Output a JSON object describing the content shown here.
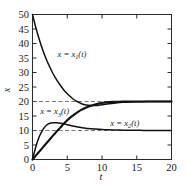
{
  "chart_data": {
    "type": "line",
    "title": "",
    "xlabel": "t",
    "ylabel": "x",
    "xlim": [
      0,
      20
    ],
    "ylim": [
      0,
      50
    ],
    "grid": false,
    "legend_position": "inline-annotations",
    "xticks": [
      "0",
      "5",
      "10",
      "15",
      "20"
    ],
    "xtick_values": [
      0,
      5,
      10,
      15,
      20
    ],
    "yticks": [
      "0",
      "5",
      "10",
      "15",
      "20",
      "25",
      "30",
      "35",
      "40",
      "45",
      "50"
    ],
    "ytick_values": [
      0,
      5,
      10,
      15,
      20,
      25,
      30,
      35,
      40,
      45,
      50
    ],
    "annotations": [
      {
        "name": "label-x1",
        "text_plain": "x = x1(t)",
        "base": "x = x",
        "sub": "1",
        "tail": "(t)",
        "x": 3.6,
        "y": 36.5
      },
      {
        "name": "label-x3",
        "text_plain": "x = x3(t)",
        "base": "x = x",
        "sub": "3",
        "tail": "(t)",
        "x": 1.1,
        "y": 16.6
      },
      {
        "name": "label-x2",
        "text_plain": "x = x2(t)",
        "base": "x = x",
        "sub": "2",
        "tail": "(t)",
        "x": 11.2,
        "y": 12.6
      }
    ],
    "asymptotes": [
      {
        "name": "asymptote-20",
        "value": 20,
        "style": "dashed"
      },
      {
        "name": "asymptote-10",
        "value": 10,
        "style": "dashed"
      }
    ],
    "series": [
      {
        "name": "x1",
        "label": "x = x1(t)",
        "start": 50,
        "limit": 20,
        "description": "exponential decay from 50 to asymptote 20",
        "x": [
          0,
          0.5,
          1,
          1.5,
          2,
          2.5,
          3,
          3.5,
          4,
          4.5,
          5,
          5.5,
          6,
          6.5,
          7,
          7.5,
          8,
          9,
          10,
          11,
          12,
          13,
          14,
          15,
          16,
          17,
          18,
          19,
          20
        ],
        "values": [
          50.0,
          45.3,
          41.2,
          37.6,
          34.5,
          31.8,
          29.4,
          27.4,
          25.6,
          24.0,
          22.7,
          21.6,
          20.6,
          19.9,
          19.3,
          18.9,
          18.7,
          18.6,
          18.9,
          19.2,
          19.5,
          19.7,
          19.8,
          19.9,
          19.95,
          20.0,
          20.0,
          20.0,
          20.0
        ]
      },
      {
        "name": "x2",
        "label": "x = x2(t)",
        "start": 0,
        "limit": 20,
        "description": "monotone rise from 0 to asymptote 20",
        "x": [
          0,
          0.5,
          1,
          1.5,
          2,
          2.5,
          3,
          3.5,
          4,
          4.5,
          5,
          5.5,
          6,
          6.5,
          7,
          7.5,
          8,
          8.5,
          9,
          9.5,
          10,
          11,
          12,
          13,
          14,
          15,
          16,
          17,
          18,
          19,
          20
        ],
        "values": [
          0.0,
          1.4,
          2.8,
          4.2,
          5.6,
          7.0,
          8.4,
          9.7,
          11.0,
          12.3,
          13.5,
          14.6,
          15.5,
          16.3,
          17.1,
          17.7,
          18.2,
          18.6,
          19.0,
          19.3,
          19.5,
          19.8,
          19.9,
          20.0,
          20.0,
          20.0,
          20.0,
          20.0,
          20.0,
          20.0,
          20.0
        ]
      },
      {
        "name": "x3",
        "label": "x = x3(t)",
        "start": 0,
        "limit": 10,
        "peak_x": 3.0,
        "peak_y": 12.7,
        "description": "rises from 0 to peak 12.7 near t=3 then decays to asymptote 10",
        "x": [
          0,
          0.5,
          1,
          1.5,
          2,
          2.5,
          3,
          3.5,
          4,
          4.5,
          5,
          5.5,
          6,
          6.5,
          7,
          7.5,
          8,
          9,
          10,
          11,
          12,
          13,
          14,
          15,
          16,
          17,
          18,
          19,
          20
        ],
        "values": [
          0.0,
          4.6,
          8.0,
          10.3,
          11.8,
          12.5,
          12.7,
          12.65,
          12.5,
          12.3,
          12.0,
          11.7,
          11.45,
          11.2,
          11.0,
          10.85,
          10.7,
          10.5,
          10.33,
          10.23,
          10.16,
          10.11,
          10.08,
          10.05,
          10.04,
          10.03,
          10.02,
          10.01,
          10.0
        ]
      }
    ]
  },
  "figure": {
    "axis_color": "#2b2b2b",
    "curve_color": "#111111",
    "asymptote_color": "#555555",
    "background": "#ffffff"
  }
}
